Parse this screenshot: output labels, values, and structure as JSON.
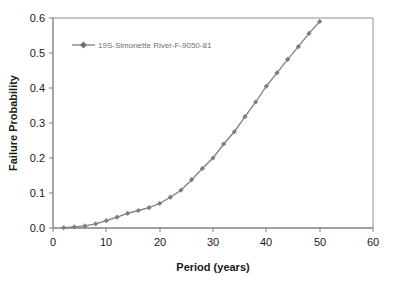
{
  "chart_data": {
    "type": "line",
    "title": "",
    "xlabel": "Period (years)",
    "ylabel": "Failure Probability",
    "xlim": [
      0,
      60
    ],
    "ylim": [
      0.0,
      0.6
    ],
    "xticks": [
      "0",
      "10",
      "20",
      "30",
      "40",
      "50",
      "60"
    ],
    "yticks": [
      "0.0",
      "0.1",
      "0.2",
      "0.3",
      "0.4",
      "0.5",
      "0.6"
    ],
    "xtick_values": [
      0,
      10,
      20,
      30,
      40,
      50,
      60
    ],
    "ytick_values": [
      0.0,
      0.1,
      0.2,
      0.3,
      0.4,
      0.5,
      0.6
    ],
    "grid": false,
    "legend_position": "upper-left-inside",
    "marker": "diamond",
    "line_color": "#7f7f7f",
    "marker_color": "#7f7f7f",
    "series": [
      {
        "name": "19S-Simonette River-F-9050-81",
        "x": [
          2,
          4,
          6,
          8,
          10,
          12,
          14,
          16,
          18,
          20,
          22,
          24,
          26,
          28,
          30,
          32,
          34,
          36,
          38,
          40,
          42,
          44,
          46,
          48,
          50
        ],
        "values": [
          0.001,
          0.003,
          0.006,
          0.012,
          0.021,
          0.031,
          0.042,
          0.05,
          0.058,
          0.07,
          0.088,
          0.108,
          0.138,
          0.17,
          0.2,
          0.24,
          0.275,
          0.318,
          0.36,
          0.405,
          0.443,
          0.482,
          0.518,
          0.556,
          0.59
        ]
      }
    ]
  },
  "legend": {
    "entries": [
      {
        "label": "19S-Simonette River-F-9050-81"
      }
    ]
  },
  "axes": {
    "x_title": "Period (years)",
    "y_title": "Failure Probability"
  },
  "colors": {
    "series": "#7f7f7f",
    "axis": "#808080",
    "text": "#1a1a1a",
    "legend_text": "#6f6f6f",
    "background": "#ffffff"
  }
}
